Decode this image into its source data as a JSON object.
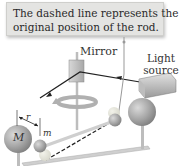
{
  "callout": {
    "line1": "The dashed line represents the",
    "line2": "original position of the rod."
  },
  "labels": {
    "mirror": "Mirror",
    "light_line1": "Light",
    "light_line2": "source",
    "big_mass": "M",
    "small_mass": "m",
    "distance": "r"
  },
  "colors": {
    "callout_bg": "#e4e4e2",
    "sphere": "#a8a8a8",
    "rod": "#c8c8c8",
    "beam": "#222222"
  }
}
